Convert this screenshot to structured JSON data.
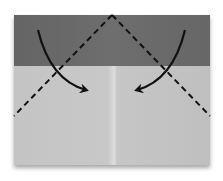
{
  "diagram": {
    "type": "origami-fold-step",
    "colors": {
      "background": "#ffffff",
      "paper_colored_side": "#6a6a6a",
      "paper_white_side": "#c9c9c9",
      "center_crease": "#dcdcdc",
      "lines": "#111111"
    },
    "elements": {
      "paper": "paper-sheet",
      "band": "colored-top-band",
      "crease": "center-crease",
      "fold_lines": [
        "left-valley-fold-line",
        "right-valley-fold-line"
      ],
      "arrows": [
        "left-fold-arrow",
        "right-fold-arrow"
      ]
    }
  }
}
